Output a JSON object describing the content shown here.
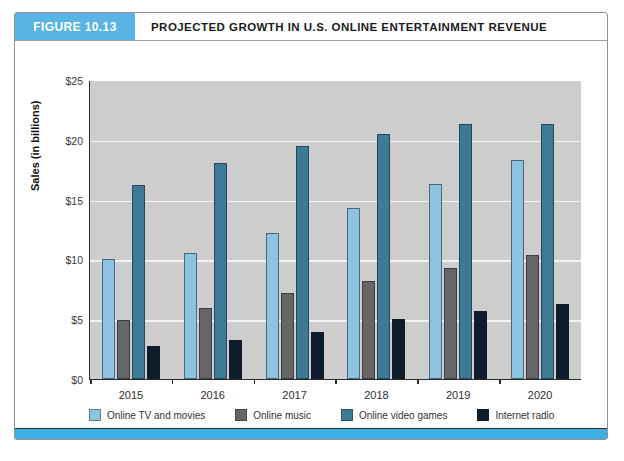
{
  "figure": {
    "badge": "FIGURE 10.13",
    "title": "PROJECTED GROWTH IN U.S. ONLINE ENTERTAINMENT REVENUE"
  },
  "chart_data": {
    "type": "bar",
    "title": "PROJECTED GROWTH IN U.S. ONLINE ENTERTAINMENT REVENUE",
    "xlabel": "",
    "ylabel": "Sales (in billions)",
    "ylim": [
      0,
      25
    ],
    "ytick_values": [
      0,
      5,
      10,
      15,
      20,
      25
    ],
    "ytick_labels": [
      "$0",
      "$5",
      "$10",
      "$15",
      "$20",
      "$25"
    ],
    "grid": true,
    "legend_position": "bottom",
    "categories": [
      "2015",
      "2016",
      "2017",
      "2018",
      "2019",
      "2020"
    ],
    "series": [
      {
        "name": "Online TV and movies",
        "color": "#8cc3e0",
        "values": [
          10.0,
          10.5,
          12.2,
          14.3,
          16.3,
          18.3
        ]
      },
      {
        "name": "Online music",
        "color": "#666666",
        "values": [
          4.9,
          5.9,
          7.2,
          8.2,
          9.3,
          10.4
        ]
      },
      {
        "name": "Online video games",
        "color": "#3d7a95",
        "values": [
          16.2,
          18.1,
          19.5,
          20.5,
          21.3,
          21.3
        ]
      },
      {
        "name": "Internet radio",
        "color": "#0d1c2b",
        "values": [
          2.8,
          3.3,
          3.9,
          5.0,
          5.7,
          6.3
        ]
      }
    ]
  },
  "colors": {
    "badge": "#57b4e3",
    "footer_bar": "#3fb0e4",
    "plot_background": "#cdcdcd",
    "gridline": "#f2f2f2"
  }
}
